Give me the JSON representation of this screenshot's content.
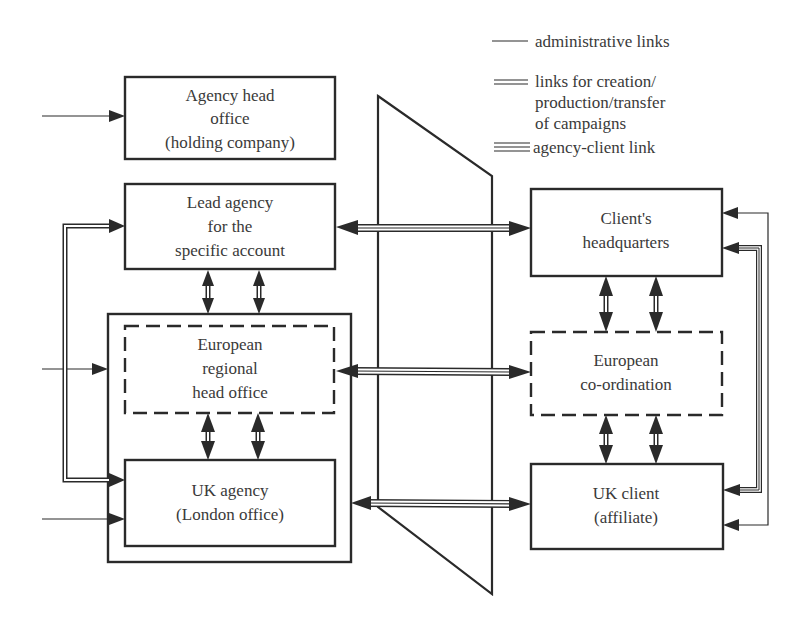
{
  "legend": {
    "items": [
      {
        "line_style": "single",
        "label": "administrative links"
      },
      {
        "line_style": "double",
        "label_lines": [
          "links for creation/",
          "production/transfer",
          "of campaigns"
        ]
      },
      {
        "line_style": "triple",
        "label": "agency-client link"
      }
    ]
  },
  "agency_side": {
    "head_office": {
      "lines": [
        "Agency head",
        "office",
        "(holding company)"
      ],
      "border": "solid"
    },
    "lead_agency": {
      "lines": [
        "Lead agency",
        "for the",
        "specific account"
      ],
      "border": "solid"
    },
    "european_regional": {
      "lines": [
        "European",
        "regional",
        "head office"
      ],
      "border": "dashed"
    },
    "uk_agency": {
      "lines": [
        "UK agency",
        "(London office)"
      ],
      "border": "solid"
    }
  },
  "client_side": {
    "headquarters": {
      "lines": [
        "Client's",
        "headquarters"
      ],
      "border": "solid"
    },
    "european_coordination": {
      "lines": [
        "European",
        "co-ordination"
      ],
      "border": "dashed"
    },
    "uk_client": {
      "lines": [
        "UK client",
        "(affiliate)"
      ],
      "border": "solid"
    }
  },
  "links": [
    {
      "from": "external",
      "to": "head_office",
      "type": "administrative"
    },
    {
      "from": "external",
      "to": "european_regional_container",
      "type": "administrative"
    },
    {
      "from": "external",
      "to": "uk_agency",
      "type": "administrative"
    },
    {
      "from": "lead_agency",
      "to": "uk_agency",
      "type": "creation/production/transfer"
    },
    {
      "from": "lead_agency",
      "to": "european_regional",
      "type": "creation/production/transfer",
      "bidirectional": true
    },
    {
      "from": "european_regional",
      "to": "uk_agency",
      "type": "creation/production/transfer",
      "bidirectional": true
    },
    {
      "from": "lead_agency",
      "to": "headquarters",
      "type": "agency-client",
      "bidirectional": true
    },
    {
      "from": "european_regional",
      "to": "european_coordination",
      "type": "agency-client",
      "bidirectional": true
    },
    {
      "from": "uk_agency",
      "to": "uk_client",
      "type": "agency-client",
      "bidirectional": true
    },
    {
      "from": "headquarters",
      "to": "european_coordination",
      "type": "creation/production/transfer",
      "bidirectional": true
    },
    {
      "from": "european_coordination",
      "to": "uk_client",
      "type": "creation/production/transfer",
      "bidirectional": true
    },
    {
      "from": "uk_client",
      "to": "headquarters",
      "type": "administrative"
    },
    {
      "from": "headquarters",
      "to": "uk_client",
      "type": "agency-client"
    }
  ]
}
